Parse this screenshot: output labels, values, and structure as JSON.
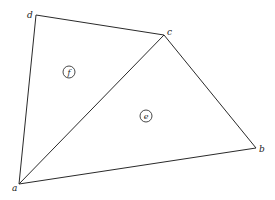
{
  "diagram": {
    "type": "planar-graph",
    "vertices": [
      {
        "id": "a",
        "label": "a",
        "x": 19,
        "y": 184,
        "lx": 12,
        "ly": 191
      },
      {
        "id": "b",
        "label": "b",
        "x": 256,
        "y": 148,
        "lx": 259,
        "ly": 152
      },
      {
        "id": "c",
        "label": "c",
        "x": 164,
        "y": 35,
        "lx": 167,
        "ly": 35
      },
      {
        "id": "d",
        "label": "d",
        "x": 36,
        "y": 15,
        "lx": 27,
        "ly": 18
      }
    ],
    "edges": [
      {
        "from": "d",
        "to": "c"
      },
      {
        "from": "d",
        "to": "a"
      },
      {
        "from": "a",
        "to": "c"
      },
      {
        "from": "c",
        "to": "b"
      },
      {
        "from": "a",
        "to": "b"
      }
    ],
    "faces": [
      {
        "id": "f",
        "label": "f",
        "cx": 69,
        "cy": 72,
        "r": 6
      },
      {
        "id": "e",
        "label": "e",
        "cx": 146,
        "cy": 116,
        "r": 6
      }
    ],
    "colors": {
      "line": "#2a2a2a",
      "background": "#ffffff"
    }
  }
}
